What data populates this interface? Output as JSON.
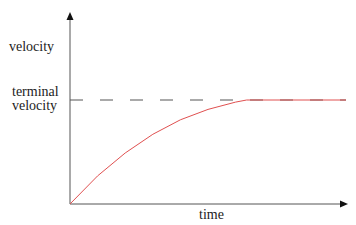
{
  "chart_data": {
    "type": "line",
    "title": "",
    "xlabel": "time",
    "ylabel": "velocity",
    "annotations": [
      {
        "text": "terminal velocity",
        "y_ref": "terminal_velocity",
        "style": "dashed horizontal line"
      }
    ],
    "grid": false,
    "legend": null,
    "series": [
      {
        "name": "velocity",
        "color": "#e05050",
        "x": [
          0,
          0.1,
          0.2,
          0.3,
          0.4,
          0.5,
          0.6,
          0.64,
          0.8,
          1.0
        ],
        "values": [
          0,
          0.27,
          0.49,
          0.67,
          0.81,
          0.91,
          0.98,
          1.0,
          1.0,
          1.0
        ]
      }
    ],
    "reference_lines": [
      {
        "name": "terminal velocity",
        "y": 1.0,
        "color": "#555555",
        "style": "dashed"
      }
    ],
    "xlim": [
      0,
      1
    ],
    "ylim": [
      0,
      1.8
    ]
  },
  "labels": {
    "y_axis": "velocity",
    "terminal_line1": "terminal",
    "terminal_line2": "velocity",
    "x_axis": "time"
  }
}
